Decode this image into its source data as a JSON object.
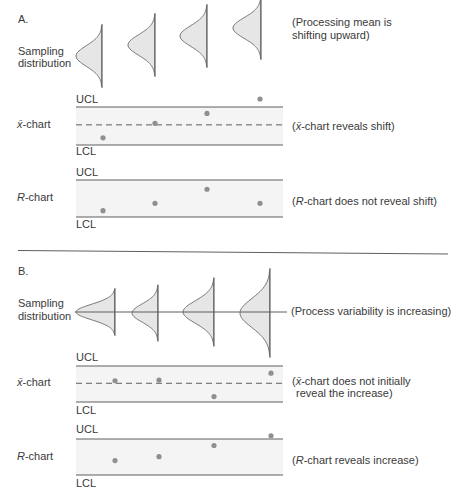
{
  "panels": [
    {
      "id": "A",
      "label": "A.",
      "sampling_label_1": "Sampling",
      "sampling_label_2": "distribution",
      "sampling_note_1": "(Processing mean is",
      "sampling_note_2": "shifting upward)",
      "xbar": {
        "symbol": "x̄",
        "label_suffix": "-chart",
        "ucl": "UCL",
        "lcl": "LCL",
        "note_open": "(",
        "note_symbol": "x̄",
        "note_rest": "-chart reveals shift)"
      },
      "r": {
        "symbol": "R",
        "label_suffix": "-chart",
        "ucl": "UCL",
        "lcl": "LCL",
        "note_open": "(",
        "note_symbol": "R",
        "note_rest": "-chart does not reveal shift)"
      }
    },
    {
      "id": "B",
      "label": "B.",
      "sampling_label_1": "Sampling",
      "sampling_label_2": "distribution",
      "sampling_note_1": "(Process variability is increasing)",
      "xbar": {
        "symbol": "x̄",
        "label_suffix": "-chart",
        "ucl": "UCL",
        "lcl": "LCL",
        "note_open": "(",
        "note_symbol": "x̄",
        "note_rest": "-chart does not initially",
        "note_line2": "reveal the increase)"
      },
      "r": {
        "symbol": "R",
        "label_suffix": "-chart",
        "ucl": "UCL",
        "lcl": "LCL",
        "note_open": "(",
        "note_symbol": "R",
        "note_rest": "-chart reveals increase)"
      }
    }
  ],
  "colors": {
    "text": "#3a3a3a",
    "line": "#5e5e5e",
    "band": "#f4f4f4",
    "point": "#8f8f8f",
    "curve_fill": "#e6e6e6",
    "curve_stroke": "#777777"
  },
  "chart_data": [
    {
      "type": "control_chart",
      "panel": "A",
      "title": "Sampling distribution",
      "annotation": "(Processing mean is shifting upward)",
      "distributions_units": "px",
      "distributions": [
        {
          "baseline_x": 102,
          "center_y": 56,
          "sd": 10.3,
          "peak": 26
        },
        {
          "baseline_x": 155,
          "center_y": 45,
          "sd": 10.3,
          "peak": 27
        },
        {
          "baseline_x": 207,
          "center_y": 36,
          "sd": 10.3,
          "peak": 27
        },
        {
          "baseline_x": 261,
          "center_y": 28,
          "sd": 10.3,
          "peak": 28
        }
      ],
      "xbar_chart": {
        "ylabel": "x̄-chart",
        "limits": {
          "UCL": 1,
          "CL": 0.53,
          "LCL": 0
        },
        "points": [
          0.19,
          0.57,
          0.83,
          1.21
        ],
        "annotation": "(x̄-chart reveals shift)"
      },
      "r_chart": {
        "ylabel": "R-chart",
        "limits": {
          "UCL": 1,
          "LCL": 0
        },
        "points": [
          0.17,
          0.37,
          0.75,
          0.37
        ],
        "annotation": "(R-chart does not reveal shift)"
      }
    },
    {
      "type": "control_chart",
      "panel": "B",
      "title": "Sampling distribution",
      "annotation": "(Process variability is increasing)",
      "distributions_units": "px",
      "distributions": [
        {
          "baseline_x": 115,
          "center_y": 312,
          "sd": 7.7,
          "peak": 39
        },
        {
          "baseline_x": 158,
          "center_y": 313,
          "sd": 9.2,
          "peak": 26
        },
        {
          "baseline_x": 214,
          "center_y": 312,
          "sd": 11.2,
          "peak": 31
        },
        {
          "baseline_x": 270,
          "center_y": 313,
          "sd": 14.5,
          "peak": 30
        }
      ],
      "xbar_chart": {
        "ylabel": "x̄-chart",
        "limits": {
          "UCL": 1,
          "CL": 0.52,
          "LCL": 0
        },
        "points": [
          0.59,
          0.61,
          0.15,
          0.8
        ],
        "annotation": "(x̄-chart does not initially reveal the increase)"
      },
      "r_chart": {
        "ylabel": "R-chart",
        "limits": {
          "UCL": 1,
          "LCL": 0
        },
        "points": [
          0.4,
          0.51,
          0.82,
          1.09
        ],
        "annotation": "(R-chart reveals increase)"
      }
    }
  ]
}
